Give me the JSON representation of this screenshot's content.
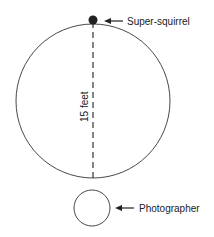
{
  "diagram": {
    "labels": {
      "top": "Super-squirrel",
      "bottom": "Photographer",
      "distance": "15 feet"
    },
    "colors": {
      "line": "#333333",
      "dot": "#222222",
      "text": "#222222"
    }
  }
}
